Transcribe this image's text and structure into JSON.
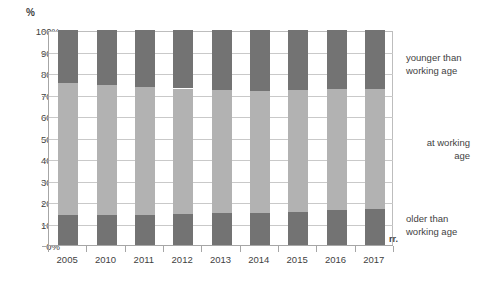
{
  "chart_data": {
    "type": "bar",
    "subtype": "stacked-percentage-column",
    "title": "",
    "subtitle": "",
    "xlabel": "rr.",
    "ylabel": "%",
    "categories": [
      "2005",
      "2010",
      "2011",
      "2012",
      "2013",
      "2014",
      "2015",
      "2016",
      "2017"
    ],
    "series": [
      {
        "name": "older than working age",
        "color": "#737373",
        "values": [
          14.0,
          14.0,
          14.1,
          14.4,
          14.7,
          14.8,
          15.3,
          16.3,
          16.7
        ]
      },
      {
        "name": "at working age",
        "color": "#b2b2b2",
        "values": [
          61.2,
          60.2,
          59.3,
          58.4,
          57.6,
          57.0,
          56.6,
          56.1,
          55.9
        ]
      },
      {
        "name": "younger than working age",
        "color": "#737373",
        "values": [
          24.8,
          25.8,
          26.6,
          27.2,
          27.7,
          28.2,
          28.1,
          27.6,
          27.4
        ]
      }
    ],
    "ylim": [
      0,
      100
    ],
    "yticks": [
      "0%",
      "10%",
      "20%",
      "30%",
      "40%",
      "50%",
      "60%",
      "70%",
      "80%",
      "90%",
      "100%"
    ],
    "ytick_values": [
      0,
      10,
      20,
      30,
      40,
      50,
      60,
      70,
      80,
      90,
      100
    ],
    "grid": true,
    "grid_axis": "y",
    "legend_position": "right",
    "legend": [
      "younger than working age",
      "at working age",
      "older than working age"
    ]
  },
  "axes": {
    "y_unit_label": "%",
    "x_unit_label": "rr."
  },
  "legend_text": {
    "younger": "younger than\nworking age",
    "younger_line1": "younger than",
    "younger_line2": "working age",
    "working_line1": "at working",
    "working_line2": "age",
    "older_line1": "older than",
    "older_line2": "working age"
  },
  "colors": {
    "dark_segment": "#737373",
    "light_segment": "#b2b2b2",
    "grid": "#c9c9c9",
    "axis": "#a6a6a6",
    "text": "#3f3f3f",
    "background": "#ffffff"
  }
}
